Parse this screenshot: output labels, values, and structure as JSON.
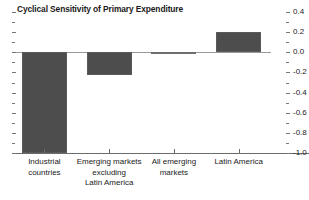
{
  "chart_data": {
    "type": "bar",
    "title": "Cyclical Sensitivity of Primary Expenditure",
    "xlabel": "",
    "ylabel": "",
    "ylim": [
      -1.0,
      0.4
    ],
    "ytick_step": 0.2,
    "minor_ticks": true,
    "grid": false,
    "legend": "none",
    "axis_position": "right",
    "zero_line": 0.0,
    "bar_color": "#4d4d4d",
    "categories": [
      "Industrial\ncountries",
      "Emerging markets\nexcluding\nLatin America",
      "All emerging\nmarkets",
      "Latin America"
    ],
    "values": [
      -1.0,
      -0.23,
      -0.01,
      0.2
    ],
    "ytick_labels": [
      "0.4",
      "0.2",
      "0.0",
      "-0.2",
      "-0.4",
      "-0.6",
      "-0.8",
      "-1.0"
    ],
    "ytick_values": [
      0.4,
      0.2,
      0.0,
      -0.2,
      -0.4,
      -0.6,
      -0.8,
      -1.0
    ]
  }
}
